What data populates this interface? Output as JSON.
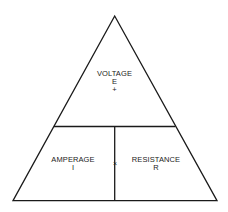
{
  "diagram": {
    "top": {
      "name": "VOLTAGE",
      "symbol": "E",
      "operator": "+"
    },
    "bottom_left": {
      "name": "AMPERAGE",
      "symbol": "I"
    },
    "bottom_right": {
      "name": "RESISTANCE",
      "symbol": "R"
    },
    "middle_operator": "×",
    "colors": {
      "line": "#1a1a1a",
      "text": "#222222",
      "background": "#ffffff"
    }
  }
}
